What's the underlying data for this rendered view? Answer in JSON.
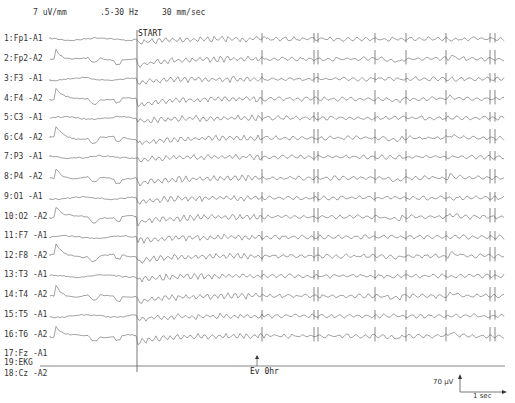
{
  "header": {
    "sensitivity": "7 uV/mm",
    "filter": ".5-30 Hz",
    "speed": "30  mm/sec"
  },
  "markers": {
    "start": "START",
    "event": "Ev 0hr"
  },
  "calibration": {
    "amplitude": "70 µV",
    "time": "1 sec"
  },
  "chart_data": {
    "type": "line",
    "subtitle": "7 uV/mm  .5-30 Hz  30 mm/sec",
    "xlabel": "time",
    "ylabel": "channels",
    "grid": false,
    "annotations": [
      "START (vertical marker)",
      "Ev 0hr (event arrow)",
      "Calibration: 70 µV / 1 sec"
    ],
    "marker_x_px": {
      "start": 137,
      "event": 257
    },
    "artifact_spike_x_px": [
      262,
      314,
      318,
      375,
      406,
      446,
      490,
      495
    ],
    "channels": [
      "1:Fp1-A1",
      "2:Fp2-A2",
      "3:F3 -A1",
      "4:F4 -A2",
      "5:C3 -A1",
      "6:C4 -A2",
      "7:P3 -A1",
      "8:P4 -A2",
      "9:O1 -A1",
      "10:O2 -A2",
      "11:F7 -A1",
      "12:F8 -A2",
      "13:T3 -A1",
      "14:T4 -A2",
      "15:T5 -A1",
      "16:T6 -A2",
      "17:Fz -A1",
      "18:Cz -A2",
      "19:EKG"
    ],
    "channel_baseline_y_px": [
      39,
      59,
      79,
      99,
      118,
      138,
      157,
      178,
      198,
      217,
      237,
      256,
      276,
      296,
      316,
      336,
      356,
      376,
      366
    ]
  },
  "channels": [
    {
      "num": "1",
      "name": "Fp1-A1",
      "y": 34
    },
    {
      "num": "2",
      "name": "Fp2-A2",
      "y": 54
    },
    {
      "num": "3",
      "name": "F3 -A1",
      "y": 74
    },
    {
      "num": "4",
      "name": "F4 -A2",
      "y": 94
    },
    {
      "num": "5",
      "name": "C3 -A1",
      "y": 113
    },
    {
      "num": "6",
      "name": "C4 -A2",
      "y": 133
    },
    {
      "num": "7",
      "name": "P3 -A1",
      "y": 152
    },
    {
      "num": "8",
      "name": "P4 -A2",
      "y": 172
    },
    {
      "num": "9",
      "name": "O1 -A1",
      "y": 192
    },
    {
      "num": "10",
      "name": "O2 -A2",
      "y": 212
    },
    {
      "num": "11",
      "name": "F7 -A1",
      "y": 231
    },
    {
      "num": "12",
      "name": "F8 -A2",
      "y": 251
    },
    {
      "num": "13",
      "name": "T3 -A1",
      "y": 270
    },
    {
      "num": "14",
      "name": "T4 -A2",
      "y": 290
    },
    {
      "num": "15",
      "name": "T5 -A1",
      "y": 310
    },
    {
      "num": "16",
      "name": "T6 -A2",
      "y": 330
    },
    {
      "num": "17",
      "name": "Fz -A1",
      "y": 349
    },
    {
      "num": "18",
      "name": "Cz -A2",
      "y": 369
    },
    {
      "num": "19",
      "name": "EKG",
      "y": 389
    }
  ]
}
